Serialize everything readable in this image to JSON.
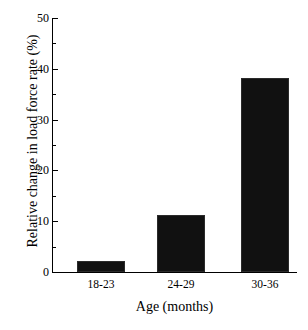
{
  "chart_data": {
    "type": "bar",
    "title": "",
    "xlabel": "Age (months)",
    "ylabel": "Relative change in load force rate (%)",
    "categories": [
      "18-23",
      "24-29",
      "30-36"
    ],
    "values": [
      2.2,
      11.2,
      38.2
    ],
    "series": [
      {
        "name": "Relative change in load force rate",
        "values": [
          2.2,
          11.2,
          38.2
        ]
      }
    ],
    "ylim": [
      0,
      50
    ],
    "y_major_ticks": [
      0,
      10,
      20,
      30,
      40,
      50
    ],
    "y_tick_labels": [
      "0",
      "10",
      "20",
      "30",
      "40",
      "50"
    ],
    "y_minor_ticks": [
      5,
      15,
      25,
      35,
      45
    ],
    "grid": false,
    "legend": null,
    "bar_color": "#111111",
    "axis_color": "#000000",
    "background_color": "#ffffff"
  }
}
